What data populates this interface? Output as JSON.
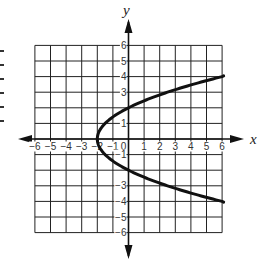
{
  "chart_data": {
    "type": "line",
    "title": "",
    "xlabel": "x",
    "ylabel": "y",
    "xlim": [
      -6,
      6
    ],
    "ylim": [
      -6,
      6
    ],
    "grid": true,
    "x_ticks": [
      "-6",
      "-5",
      "-4",
      "-3",
      "-2",
      "-1",
      "0",
      "1",
      "2",
      "3",
      "4",
      "5",
      "6"
    ],
    "y_ticks": [
      "6",
      "5",
      "4",
      "3",
      "1",
      "-1",
      "-3",
      "-4",
      "-5",
      "-6"
    ],
    "series": [
      {
        "name": "x = 0.5y^2 - 2",
        "description": "Sideways parabola opening right, vertex (-2, 0)",
        "points": [
          {
            "x": 6.0,
            "y": -4.0
          },
          {
            "x": 2.5,
            "y": -3.0
          },
          {
            "x": 0.0,
            "y": -2.0
          },
          {
            "x": -1.5,
            "y": -1.0
          },
          {
            "x": -2.0,
            "y": 0.0
          },
          {
            "x": -1.5,
            "y": 1.0
          },
          {
            "x": 0.0,
            "y": 2.0
          },
          {
            "x": 2.5,
            "y": 3.0
          },
          {
            "x": 6.0,
            "y": 4.0
          }
        ]
      }
    ],
    "vertex": {
      "x": -2,
      "y": 0
    },
    "line_color": "#111111",
    "grid_color": "#222222"
  },
  "labels": {
    "x_axis": "x",
    "y_axis": "y"
  }
}
